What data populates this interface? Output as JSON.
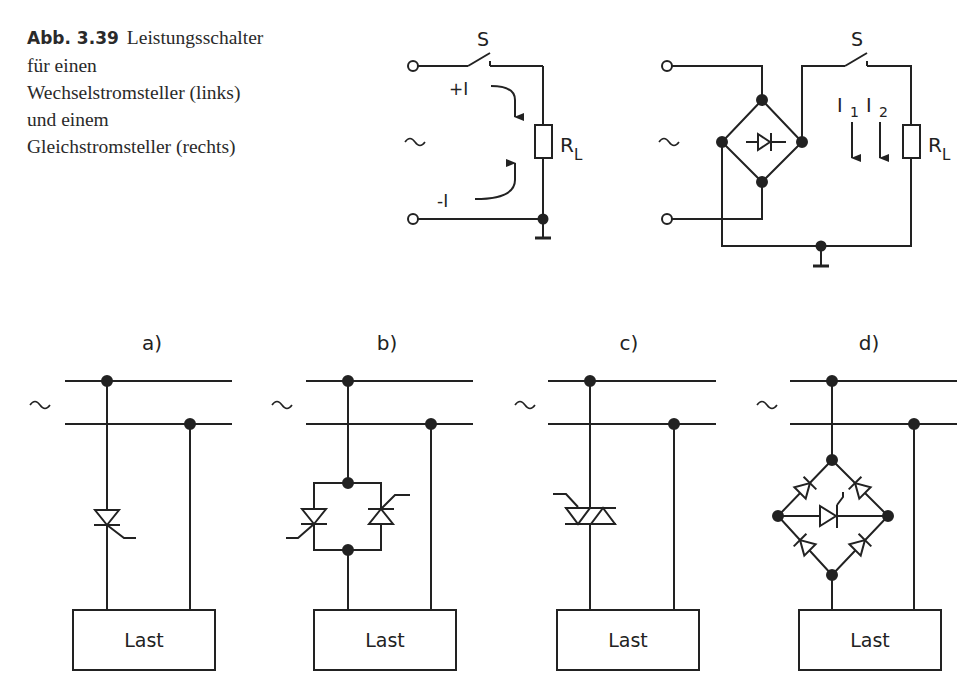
{
  "caption": {
    "figure_number": "Abb. 3.39",
    "lines": [
      "Leistungsschalter",
      "für einen",
      "Wechselstromsteller (links)",
      "und einem",
      "Gleichstromsteller (rechts)"
    ]
  },
  "left_circuit": {
    "switch_label": "S",
    "resistor_label": "R",
    "resistor_sub": "L",
    "current_pos": "+I",
    "current_neg": "-I",
    "source_symbol": "~"
  },
  "right_circuit": {
    "switch_label": "S",
    "resistor_label": "R",
    "resistor_sub": "L",
    "current1": "I",
    "current1_sub": "1",
    "current2": "I",
    "current2_sub": "2",
    "source_symbol": "~"
  },
  "panels": [
    {
      "label": "a)",
      "load": "Last",
      "source_symbol": "~"
    },
    {
      "label": "b)",
      "load": "Last",
      "source_symbol": "~"
    },
    {
      "label": "c)",
      "load": "Last",
      "source_symbol": "~"
    },
    {
      "label": "d)",
      "load": "Last",
      "source_symbol": "~"
    }
  ]
}
